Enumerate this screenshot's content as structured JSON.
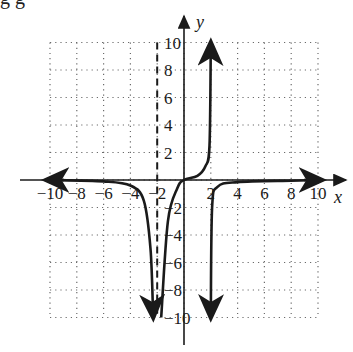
{
  "header": {
    "cropped_text": "g g"
  },
  "chart_data": {
    "type": "line",
    "title": "",
    "xlabel": "x",
    "ylabel": "y",
    "xlim": [
      -10,
      10
    ],
    "ylim": [
      -10,
      10
    ],
    "grid": true,
    "grid_style": "dotted",
    "x_ticks": [
      -10,
      -8,
      -6,
      -4,
      -2,
      2,
      4,
      6,
      8,
      10
    ],
    "y_ticks": [
      -10,
      -8,
      -6,
      -4,
      -2,
      2,
      4,
      6,
      8,
      10
    ],
    "x_tick_labels": [
      "-10",
      "-8",
      "-6",
      "-4",
      "-2",
      "2",
      "4",
      "6",
      "8",
      "10"
    ],
    "y_tick_labels": [
      "10",
      "8",
      "6",
      "4",
      "2",
      "-2",
      "-4",
      "-6",
      "-8",
      "-10"
    ],
    "asymptotes": [
      {
        "type": "vertical",
        "x": -2,
        "style": "dashed"
      }
    ],
    "series": [
      {
        "name": "left-branch",
        "description": "from y≈0 at x=-10, descends to -∞ approaching x=-2 from left",
        "points": [
          [
            -10,
            0
          ],
          [
            -6,
            -0.1
          ],
          [
            -4,
            -0.4
          ],
          [
            -3,
            -1.5
          ],
          [
            -2.5,
            -5
          ],
          [
            -2.3,
            -10
          ]
        ]
      },
      {
        "name": "middle-branch",
        "description": "from -∞ just right of x=-2, passes through origin, rises to +∞ approaching x=2",
        "points": [
          [
            -1.7,
            -10
          ],
          [
            -1.2,
            -3
          ],
          [
            -0.5,
            -0.6
          ],
          [
            0,
            0
          ],
          [
            1,
            0.3
          ],
          [
            1.6,
            1
          ],
          [
            1.9,
            2.5
          ],
          [
            2,
            10
          ]
        ]
      },
      {
        "name": "right-branch",
        "description": "from -∞ just right of x=2, approaches y≈0 toward x=10",
        "points": [
          [
            2,
            -10
          ],
          [
            2.1,
            -2
          ],
          [
            2.5,
            -0.5
          ],
          [
            4,
            -0.15
          ],
          [
            8,
            -0.05
          ],
          [
            10,
            0
          ]
        ]
      }
    ]
  },
  "colors": {
    "curve": "#1a1a1a",
    "grid": "#6b6b6b",
    "axis": "#1a1a1a",
    "background": "#ffffff"
  }
}
